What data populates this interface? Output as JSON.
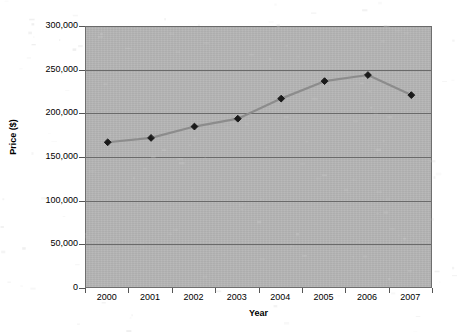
{
  "chart_data": {
    "type": "line",
    "title": "",
    "xlabel": "Year",
    "ylabel": "Price ($)",
    "categories": [
      "2000",
      "2001",
      "2002",
      "2003",
      "2004",
      "2005",
      "2006",
      "2007"
    ],
    "values": [
      168000,
      173000,
      186000,
      195000,
      218000,
      238000,
      245000,
      222000
    ],
    "series": [
      {
        "name": "Price",
        "values": [
          168000,
          173000,
          186000,
          195000,
          218000,
          238000,
          245000,
          222000
        ]
      }
    ],
    "ylim": [
      0,
      300000
    ],
    "y_ticks": [
      0,
      50000,
      100000,
      150000,
      200000,
      250000,
      300000
    ],
    "y_tick_labels": [
      "0",
      "50,000",
      "100,000",
      "150,000",
      "200,000",
      "250,000",
      "300,000"
    ],
    "x_tick_labels": [
      "2000",
      "2001",
      "2002",
      "2003",
      "2004",
      "2005",
      "2006",
      "2007"
    ],
    "grid": true,
    "grid_axis": "y",
    "legend": false,
    "legend_position": "none",
    "marker": "diamond",
    "colors": {
      "plot_background": "#b5b5b5",
      "page_background": "#ffffff",
      "gridline": "#6a6a6a",
      "axis_border": "#6e6e6e",
      "line": "#8c8c8c",
      "marker_fill": "#1a1a1a",
      "text": "#000000"
    }
  }
}
